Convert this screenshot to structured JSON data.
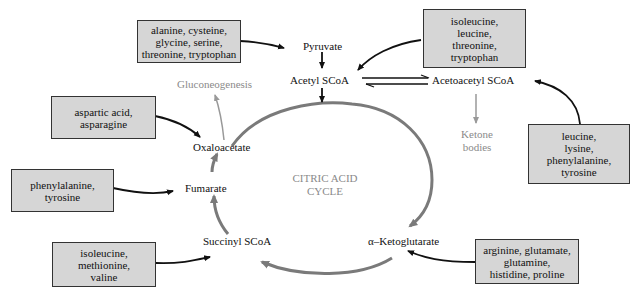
{
  "diagram": {
    "center_title": [
      "CITRIC ACID",
      "CYCLE"
    ],
    "intermediates": {
      "pyruvate": "Pyruvate",
      "acetyl": "Acetyl SCoA",
      "acetoacetyl": "Acetoacetyl SCoA",
      "oxaloacetate": "Oxaloacetate",
      "fumarate": "Fumarate",
      "succinyl": "Succinyl SCoA",
      "ketoglutarate": "α–Ketoglutarate"
    },
    "outputs": {
      "gluconeogenesis": "Gluconeogenesis",
      "ketone_bodies": [
        "Ketone",
        "bodies"
      ]
    },
    "amino_acid_boxes": {
      "to_pyruvate": [
        "alanine, cysteine,",
        "glycine, serine,",
        "threonine, tryptophan"
      ],
      "to_acetyl": [
        "isoleucine,",
        "leucine,",
        "threonine,",
        "tryptophan"
      ],
      "to_acetoacetyl": [
        "leucine,",
        "lysine,",
        "phenylalanine,",
        "tyrosine"
      ],
      "to_oxaloacetate": [
        "aspartic acid,",
        "asparagine"
      ],
      "to_fumarate": [
        "phenylalanine,",
        "tyrosine"
      ],
      "to_succinyl": [
        "isoleucine,",
        "methionine,",
        "valine"
      ],
      "to_ketoglutarate": [
        "arginine, glutamate,",
        "glutamine,",
        "histidine, proline"
      ]
    },
    "colors": {
      "box_fill": "#d6d6d6",
      "cycle_arrow": "#7a7a7a",
      "grey_text": "#8a8a8a",
      "black_arrow": "#111111"
    }
  }
}
